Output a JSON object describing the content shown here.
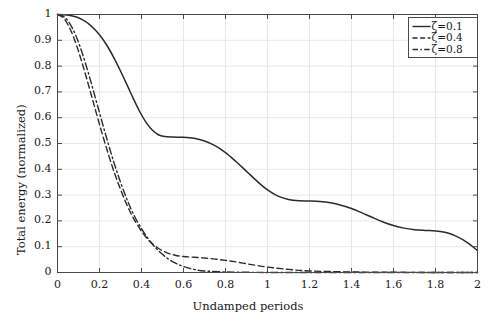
{
  "chart_data": {
    "type": "line",
    "title": "",
    "xlabel": "Undamped periods",
    "ylabel": "Total energy (normalized)",
    "xlim": [
      0,
      2
    ],
    "ylim": [
      0,
      1
    ],
    "xticks": [
      "0",
      "0.2",
      "0.4",
      "0.6",
      "0.8",
      "1",
      "1.2",
      "1.4",
      "1.6",
      "1.8",
      "2"
    ],
    "xtick_values": [
      0,
      0.2,
      0.4,
      0.6,
      0.8,
      1.0,
      1.2,
      1.4,
      1.6,
      1.8,
      2.0
    ],
    "yticks": [
      "0",
      "0.1",
      "0.2",
      "0.3",
      "0.4",
      "0.5",
      "0.6",
      "0.7",
      "0.8",
      "0.9",
      "1"
    ],
    "ytick_values": [
      0,
      0.1,
      0.2,
      0.3,
      0.4,
      0.5,
      0.6,
      0.7,
      0.8,
      0.9,
      1.0
    ],
    "grid": true,
    "grid_color": "#e8e8e8",
    "legend_position": "top-right",
    "line_color": "#2b2b2b",
    "series": [
      {
        "name": "ζ=0.1",
        "style": "solid",
        "x": [
          0.0,
          0.03,
          0.06,
          0.09,
          0.12,
          0.15,
          0.18,
          0.21,
          0.24,
          0.27,
          0.3,
          0.33,
          0.36,
          0.39,
          0.42,
          0.45,
          0.48,
          0.51,
          0.55,
          0.6,
          0.65,
          0.7,
          0.75,
          0.8,
          0.85,
          0.9,
          0.95,
          1.0,
          1.05,
          1.1,
          1.15,
          1.2,
          1.25,
          1.3,
          1.35,
          1.4,
          1.45,
          1.5,
          1.55,
          1.6,
          1.65,
          1.7,
          1.75,
          1.8,
          1.85,
          1.9,
          1.95,
          2.0
        ],
        "y": [
          1.0,
          0.999,
          0.996,
          0.99,
          0.979,
          0.963,
          0.94,
          0.911,
          0.874,
          0.83,
          0.781,
          0.729,
          0.676,
          0.626,
          0.584,
          0.553,
          0.534,
          0.527,
          0.525,
          0.524,
          0.52,
          0.51,
          0.492,
          0.465,
          0.43,
          0.392,
          0.354,
          0.32,
          0.296,
          0.283,
          0.278,
          0.277,
          0.275,
          0.27,
          0.261,
          0.248,
          0.231,
          0.213,
          0.196,
          0.182,
          0.172,
          0.166,
          0.163,
          0.161,
          0.155,
          0.14,
          0.117,
          0.085
        ]
      },
      {
        "name": "ζ=0.4",
        "style": "dashed",
        "x": [
          0.0,
          0.03,
          0.06,
          0.09,
          0.12,
          0.15,
          0.18,
          0.21,
          0.24,
          0.27,
          0.3,
          0.33,
          0.36,
          0.4,
          0.44,
          0.48,
          0.52,
          0.56,
          0.6,
          0.65,
          0.7,
          0.75,
          0.8,
          0.85,
          0.9,
          0.95,
          1.0,
          1.1,
          1.2,
          1.4,
          1.6,
          1.8,
          2.0
        ],
        "y": [
          1.0,
          0.985,
          0.944,
          0.882,
          0.805,
          0.72,
          0.632,
          0.546,
          0.464,
          0.389,
          0.322,
          0.263,
          0.213,
          0.16,
          0.12,
          0.094,
          0.077,
          0.067,
          0.062,
          0.059,
          0.056,
          0.052,
          0.047,
          0.041,
          0.034,
          0.027,
          0.021,
          0.012,
          0.006,
          0.002,
          0.001,
          0.0,
          0.0
        ]
      },
      {
        "name": "ζ=0.8",
        "style": "dashdot",
        "x": [
          0.0,
          0.03,
          0.06,
          0.09,
          0.12,
          0.15,
          0.18,
          0.21,
          0.24,
          0.27,
          0.3,
          0.33,
          0.36,
          0.4,
          0.44,
          0.48,
          0.52,
          0.56,
          0.6,
          0.65,
          0.7,
          0.8,
          0.9,
          1.0,
          1.2,
          1.5,
          2.0
        ],
        "y": [
          1.0,
          0.992,
          0.963,
          0.913,
          0.845,
          0.765,
          0.678,
          0.59,
          0.504,
          0.423,
          0.35,
          0.285,
          0.229,
          0.17,
          0.122,
          0.085,
          0.057,
          0.037,
          0.023,
          0.012,
          0.006,
          0.002,
          0.001,
          0.0,
          0.0,
          0.0,
          0.0
        ]
      }
    ]
  },
  "legend": {
    "entries": [
      {
        "label": "ζ=0.1",
        "style": "solid"
      },
      {
        "label": "ζ=0.4",
        "style": "dashed"
      },
      {
        "label": "ζ=0.8",
        "style": "dashdot"
      }
    ]
  }
}
